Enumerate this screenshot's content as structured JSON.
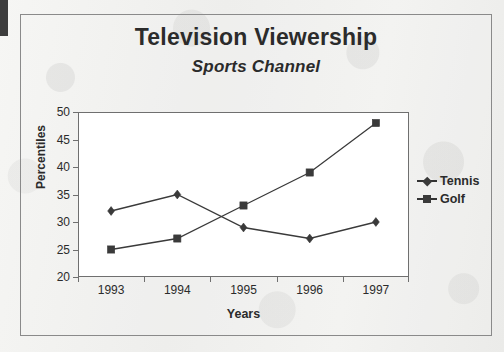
{
  "chart_data": {
    "type": "line",
    "title": "Television Viewership",
    "subtitle": "Sports Channel",
    "xlabel": "Years",
    "ylabel": "Percentiles",
    "categories": [
      "1993",
      "1994",
      "1995",
      "1996",
      "1997"
    ],
    "series": [
      {
        "name": "Tennis",
        "marker": "diamond",
        "color": "#3a3a3a",
        "values": [
          32,
          35,
          29,
          27,
          30
        ]
      },
      {
        "name": "Golf",
        "marker": "square",
        "color": "#3a3a3a",
        "values": [
          25,
          27,
          33,
          39,
          48
        ]
      }
    ],
    "ylim": [
      20,
      50
    ],
    "y_ticks": [
      "20",
      "25",
      "30",
      "35",
      "40",
      "45",
      "50"
    ],
    "grid": false,
    "legend_position": "right"
  },
  "legend": {
    "entries": [
      {
        "label": "Tennis",
        "marker": "diamond"
      },
      {
        "label": "Golf",
        "marker": "square"
      }
    ]
  },
  "colors": {
    "line": "#3a3a3a",
    "axis": "#6f6f6f",
    "frame": "#8a8a8a",
    "text": "#2b2b2b",
    "page": "#f1f1ef",
    "plot_background": "#ffffff"
  }
}
